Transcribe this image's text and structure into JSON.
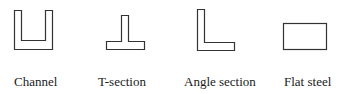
{
  "diagram": {
    "stroke_color": "#333333",
    "sections": [
      {
        "id": "channel",
        "label": "Channel"
      },
      {
        "id": "t-section",
        "label": "T-section"
      },
      {
        "id": "angle",
        "label": "Angle section"
      },
      {
        "id": "flat",
        "label": "Flat steel"
      }
    ]
  }
}
